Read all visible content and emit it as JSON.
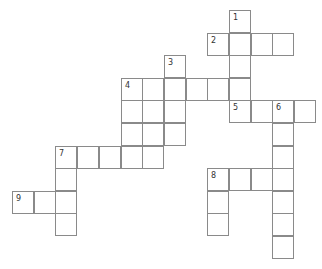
{
  "puzzle": {
    "type": "crossword",
    "grid_origin": {
      "x": 12,
      "y": 10
    },
    "cell_size": {
      "w": 21.7,
      "h": 22.6
    },
    "cells": [
      [
        0,
        10,
        "1"
      ],
      [
        1,
        9,
        "2"
      ],
      [
        1,
        10,
        ""
      ],
      [
        1,
        11,
        ""
      ],
      [
        1,
        12,
        ""
      ],
      [
        2,
        7,
        "3"
      ],
      [
        2,
        10,
        ""
      ],
      [
        3,
        5,
        "4"
      ],
      [
        3,
        6,
        ""
      ],
      [
        3,
        7,
        ""
      ],
      [
        3,
        8,
        ""
      ],
      [
        3,
        9,
        ""
      ],
      [
        3,
        10,
        ""
      ],
      [
        4,
        5,
        ""
      ],
      [
        4,
        6,
        ""
      ],
      [
        4,
        7,
        ""
      ],
      [
        4,
        10,
        "5"
      ],
      [
        4,
        11,
        ""
      ],
      [
        4,
        12,
        "6"
      ],
      [
        4,
        13,
        ""
      ],
      [
        5,
        5,
        ""
      ],
      [
        5,
        6,
        ""
      ],
      [
        5,
        7,
        ""
      ],
      [
        5,
        12,
        ""
      ],
      [
        6,
        2,
        "7"
      ],
      [
        6,
        3,
        ""
      ],
      [
        6,
        4,
        ""
      ],
      [
        6,
        5,
        ""
      ],
      [
        6,
        6,
        ""
      ],
      [
        6,
        12,
        ""
      ],
      [
        7,
        2,
        ""
      ],
      [
        7,
        9,
        "8"
      ],
      [
        7,
        10,
        ""
      ],
      [
        7,
        11,
        ""
      ],
      [
        7,
        12,
        ""
      ],
      [
        8,
        0,
        "9"
      ],
      [
        8,
        1,
        ""
      ],
      [
        8,
        2,
        ""
      ],
      [
        8,
        9,
        ""
      ],
      [
        8,
        12,
        ""
      ],
      [
        9,
        2,
        ""
      ],
      [
        9,
        9,
        ""
      ],
      [
        9,
        12,
        ""
      ],
      [
        10,
        12,
        ""
      ]
    ],
    "clue_numbers": [
      "1",
      "2",
      "3",
      "4",
      "5",
      "6",
      "7",
      "8",
      "9"
    ]
  }
}
